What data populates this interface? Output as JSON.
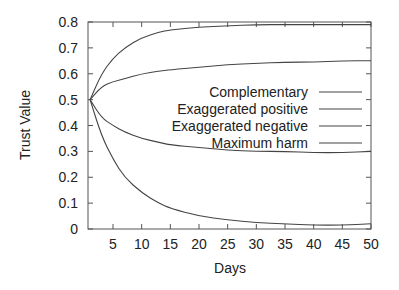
{
  "chart_data": {
    "type": "line",
    "title": "",
    "xlabel": "Days",
    "ylabel": "Trust Value",
    "xlim": [
      1,
      50
    ],
    "ylim": [
      0,
      0.8
    ],
    "xticks": [
      5,
      10,
      15,
      20,
      25,
      30,
      35,
      40,
      45,
      50
    ],
    "yticks": [
      0,
      0.1,
      0.2,
      0.3,
      0.4,
      0.5,
      0.6,
      0.7,
      0.8
    ],
    "ytick_labels": [
      "0",
      "0.1",
      "0.2",
      "0.3",
      "0.4",
      "0.5",
      "0.6",
      "0.7",
      "0.8"
    ],
    "grid": false,
    "legend_position": "inside-right-center",
    "x": [
      1,
      3,
      5,
      7,
      10,
      13,
      15,
      20,
      25,
      30,
      35,
      40,
      45,
      50
    ],
    "series": [
      {
        "name": "Complementary",
        "values": [
          0.5,
          0.6,
          0.66,
          0.7,
          0.74,
          0.76,
          0.77,
          0.78,
          0.785,
          0.79,
          0.79,
          0.79,
          0.79,
          0.79
        ]
      },
      {
        "name": "Exaggerated positive",
        "values": [
          0.5,
          0.55,
          0.57,
          0.58,
          0.6,
          0.61,
          0.615,
          0.625,
          0.635,
          0.64,
          0.645,
          0.645,
          0.65,
          0.65
        ]
      },
      {
        "name": "Exaggerated negative",
        "values": [
          0.5,
          0.43,
          0.4,
          0.375,
          0.35,
          0.335,
          0.325,
          0.315,
          0.305,
          0.3,
          0.3,
          0.295,
          0.295,
          0.3
        ]
      },
      {
        "name": "Maximum harm",
        "values": [
          0.5,
          0.36,
          0.27,
          0.2,
          0.14,
          0.1,
          0.08,
          0.05,
          0.035,
          0.025,
          0.02,
          0.015,
          0.015,
          0.02
        ]
      }
    ]
  },
  "legend": {
    "items": [
      "Complementary",
      "Exaggerated positive",
      "Exaggerated negative",
      "Maximum harm"
    ]
  },
  "axes": {
    "xlabel": "Days",
    "ylabel": "Trust Value"
  },
  "colors": {
    "line": "#444444",
    "axis": "#555555",
    "text": "#222222"
  }
}
